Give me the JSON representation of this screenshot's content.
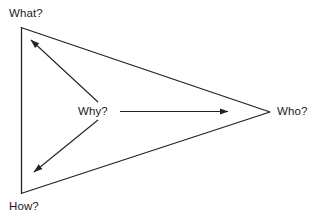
{
  "diagram": {
    "type": "triangle-relationship-diagram",
    "background_color": "#ffffff",
    "line_color": "#222222",
    "text_color": "#1a1a1a",
    "nodes": [
      {
        "id": "what",
        "label": "What?",
        "x": 21,
        "y": 27,
        "role": "triangle-vertex-top-left"
      },
      {
        "id": "how",
        "label": "How?",
        "x": 21,
        "y": 194,
        "role": "triangle-vertex-bottom-left"
      },
      {
        "id": "who",
        "label": "Who?",
        "x": 270,
        "y": 112,
        "role": "triangle-vertex-right"
      },
      {
        "id": "why",
        "label": "Why?",
        "x": 95,
        "y": 111,
        "role": "center-hub"
      }
    ],
    "arrows": [
      {
        "from": "why",
        "to": "what",
        "style": "solid-arrow"
      },
      {
        "from": "why",
        "to": "how",
        "style": "solid-arrow"
      },
      {
        "from": "why",
        "to": "who",
        "style": "solid-arrow"
      }
    ],
    "triangle_edges": [
      {
        "from": "what",
        "to": "how"
      },
      {
        "from": "what",
        "to": "who"
      },
      {
        "from": "how",
        "to": "who"
      }
    ]
  }
}
